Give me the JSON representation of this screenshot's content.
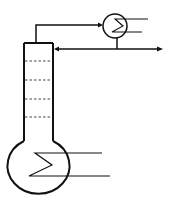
{
  "diagram": {
    "colors": {
      "stroke": "#111111",
      "background": "#ffffff"
    },
    "components": [
      {
        "id": "column",
        "type": "distillation-column",
        "trays": 4
      },
      {
        "id": "condenser",
        "type": "heat-exchanger",
        "symbol": "circle-with-zigzag"
      },
      {
        "id": "reboiler",
        "type": "heat-exchanger",
        "symbol": "flask-bulb-with-zigzag"
      },
      {
        "id": "vapor-line",
        "type": "pipe",
        "from": "column-top",
        "to": "condenser"
      },
      {
        "id": "reflux-line",
        "type": "pipe",
        "from": "condenser",
        "to": "column",
        "arrow": "into column"
      },
      {
        "id": "distillate-line",
        "type": "pipe",
        "from": "condenser",
        "to": "product-out",
        "arrow": "right"
      }
    ]
  }
}
